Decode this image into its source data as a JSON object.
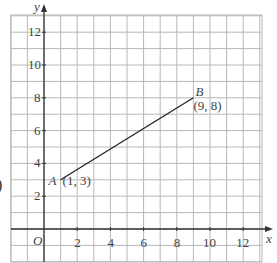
{
  "chart_data": {
    "type": "line",
    "title": "",
    "xlabel": "x",
    "ylabel": "y",
    "origin_label": "O",
    "xlim": [
      -2,
      13
    ],
    "ylim": [
      -2,
      13
    ],
    "grid": true,
    "x_ticks": [
      2,
      4,
      6,
      8,
      10,
      12
    ],
    "y_ticks": [
      2,
      4,
      6,
      8,
      10,
      12
    ],
    "series": [
      {
        "name": "AB",
        "points": [
          {
            "label": "A",
            "coord_text": "(1, 3)",
            "x": 1,
            "y": 3
          },
          {
            "label": "B",
            "coord_text": "(9, 8)",
            "x": 9,
            "y": 8
          }
        ]
      }
    ],
    "colors": {
      "grid": "#b8b8b8",
      "axis": "#333333",
      "line": "#222222"
    }
  },
  "clipped_left_text": ")"
}
